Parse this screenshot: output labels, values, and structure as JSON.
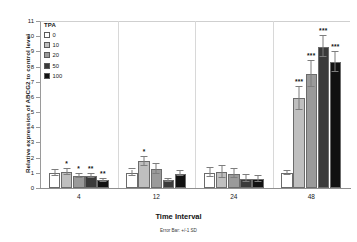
{
  "chart_data": {
    "type": "bar",
    "title": "",
    "xlabel": "Time Interval",
    "xnote": "Error Bar: +/-1 SD",
    "ylabel": "Relative expression of ABCG2 to control level",
    "ylim": [
      0,
      11
    ],
    "yticks": [
      0,
      1,
      2,
      3,
      4,
      5,
      6,
      7,
      8,
      9,
      10,
      11
    ],
    "categories": [
      "4",
      "12",
      "24",
      "48"
    ],
    "legend_title": "TPA",
    "legend_position": "top-left-inside",
    "grid": false,
    "series": [
      {
        "name": "0",
        "color": "#ffffff",
        "values": [
          1.0,
          1.0,
          1.0,
          1.0
        ],
        "errors": [
          0.18,
          0.22,
          0.3,
          0.12
        ],
        "significance": [
          "",
          "",
          "",
          ""
        ]
      },
      {
        "name": "10",
        "color": "#bfbfbf",
        "values": [
          1.05,
          1.75,
          1.05,
          5.9
        ],
        "errors": [
          0.22,
          0.3,
          0.38,
          0.75
        ],
        "significance": [
          "*",
          "*",
          "",
          "***"
        ]
      },
      {
        "name": "20",
        "color": "#9a9a9a",
        "values": [
          0.78,
          1.25,
          0.95,
          7.5
        ],
        "errors": [
          0.15,
          0.35,
          0.32,
          0.85
        ],
        "significance": [
          "*",
          "",
          "",
          "***"
        ]
      },
      {
        "name": "50",
        "color": "#3a3a3a",
        "values": [
          0.8,
          0.5,
          0.62,
          9.3
        ],
        "errors": [
          0.12,
          0.1,
          0.22,
          0.7
        ],
        "significance": [
          "**",
          "",
          "",
          "***"
        ]
      },
      {
        "name": "100",
        "color": "#111111",
        "values": [
          0.52,
          0.95,
          0.58,
          8.3
        ],
        "errors": [
          0.1,
          0.18,
          0.2,
          0.65
        ],
        "significance": [
          "**",
          "",
          "",
          "***"
        ]
      }
    ]
  }
}
